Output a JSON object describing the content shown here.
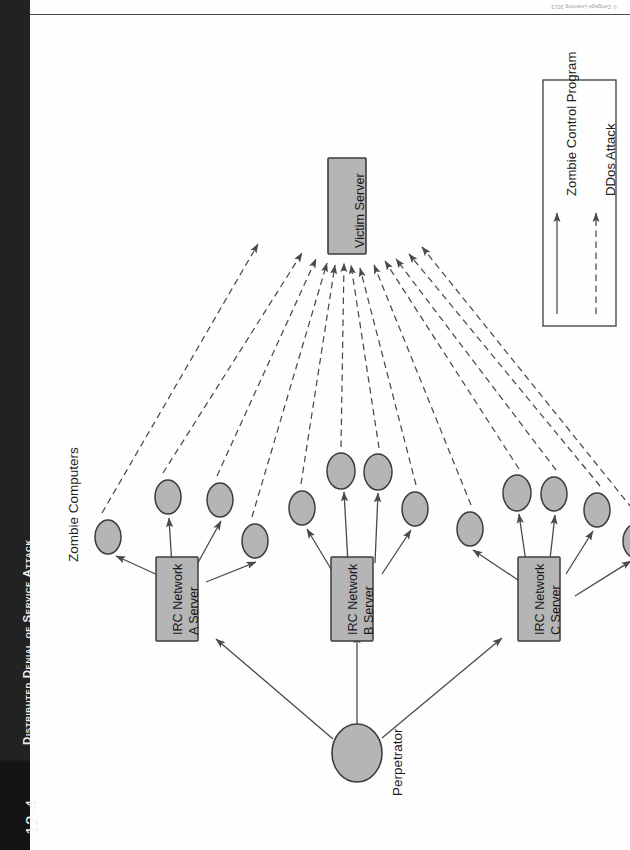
{
  "page": {
    "running_head": "Distributed Denial of Service Attack",
    "figure_number": "12-4",
    "credit": "© Cengage Learning 2013"
  },
  "diagram": {
    "title": "Distributed Denial of Service Attack",
    "group_labels": {
      "zombies": "Zombie Computers",
      "perpetrator": "Perpetrator"
    },
    "nodes": [
      {
        "id": "victim",
        "label": "Victim Server",
        "type": "box",
        "x": 330,
        "y": 190
      },
      {
        "id": "irc_a",
        "label": "IRC Network\nA Server",
        "type": "box",
        "x": 148,
        "y": 578
      },
      {
        "id": "irc_b",
        "label": "IRC Network\nB Server",
        "type": "box",
        "x": 322,
        "y": 578
      },
      {
        "id": "irc_c",
        "label": "IRC Network\nC Server",
        "type": "box",
        "x": 510,
        "y": 578
      },
      {
        "id": "perp",
        "label": "Perpetrator",
        "type": "circle",
        "x": 327,
        "y": 737
      }
    ],
    "box_labels": {
      "victim": "Victim Server",
      "irc_a_line1": "IRC Network",
      "irc_a_line2": "A Server",
      "irc_b_line1": "IRC Network",
      "irc_b_line2": "B Server",
      "irc_c_line1": "IRC Network",
      "irc_c_line2": "C Server"
    },
    "zombies": [
      {
        "id": "z1",
        "cx": 78,
        "cy": 521
      },
      {
        "id": "z2",
        "cx": 138,
        "cy": 481
      },
      {
        "id": "z3",
        "cx": 190,
        "cy": 484
      },
      {
        "id": "z4",
        "cx": 225,
        "cy": 525
      },
      {
        "id": "z5",
        "cx": 272,
        "cy": 492
      },
      {
        "id": "z6",
        "cx": 311,
        "cy": 455
      },
      {
        "id": "z7",
        "cx": 348,
        "cy": 456
      },
      {
        "id": "z8",
        "cx": 385,
        "cy": 493
      },
      {
        "id": "z9",
        "cx": 440,
        "cy": 513
      },
      {
        "id": "z10",
        "cx": 487,
        "cy": 477
      },
      {
        "id": "z11",
        "cx": 524,
        "cy": 478
      },
      {
        "id": "z12",
        "cx": 567,
        "cy": 494
      },
      {
        "id": "z13",
        "cx": 606,
        "cy": 525
      }
    ],
    "legend": {
      "items": [
        {
          "id": "control",
          "label": "Zombie Control Program",
          "style": "solid"
        },
        {
          "id": "attack",
          "label": "DDos Attack",
          "style": "dashed"
        }
      ]
    },
    "colors": {
      "node_fill": "#b5b5b5",
      "node_stroke": "#3c3c3c",
      "arrow": "#4a4a4a",
      "sidebar": "#1c1b1b",
      "text": "#1d1d1d"
    }
  }
}
